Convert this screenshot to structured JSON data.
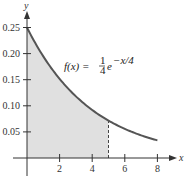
{
  "chart_data": {
    "type": "area",
    "title": "",
    "function_label": "f(x) = 1/4 e^(-x/4)",
    "formula": {
      "lhs": "f(x) =",
      "num": "1",
      "den": "4",
      "base": "e",
      "exp": "−x/4"
    },
    "xlabel": "x",
    "ylabel": "y",
    "xlim": [
      0,
      8.5
    ],
    "ylim": [
      0,
      0.27
    ],
    "x_ticks": [
      2,
      4,
      6,
      8
    ],
    "x_tick_labels": [
      "2",
      "4",
      "6",
      "8"
    ],
    "y_ticks": [
      0.05,
      0.1,
      0.15,
      0.2,
      0.25
    ],
    "y_tick_labels": [
      "0.05",
      "0.10",
      "0.15",
      "0.20",
      "0.25"
    ],
    "x": [
      0,
      1,
      2,
      3,
      4,
      5,
      6,
      7,
      8
    ],
    "values": [
      0.25,
      0.195,
      0.152,
      0.118,
      0.092,
      0.072,
      0.056,
      0.043,
      0.034
    ],
    "shaded_region": {
      "from": 0,
      "to": 5
    },
    "dashed_line_x": 5,
    "grid": false,
    "colors": {
      "curve": "#555555",
      "fill": "#e0e0e0",
      "axis": "#333333"
    }
  }
}
